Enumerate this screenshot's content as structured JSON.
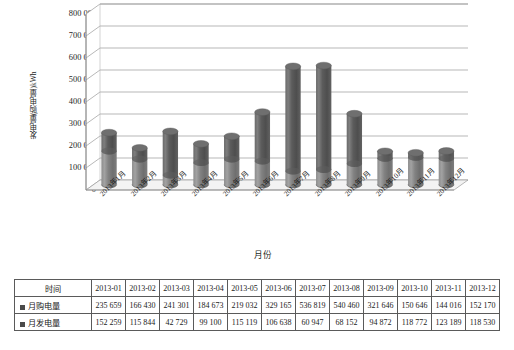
{
  "chart_data": {
    "type": "bar",
    "title": "",
    "xlabel": "月份",
    "ylabel": "发电量(购电量)kWh",
    "categories": [
      "2013年1月",
      "2013年2月",
      "2013年3月",
      "2013年4月",
      "2013年5月",
      "2013年6月",
      "2013年7月",
      "2013年8月",
      "2013年9月",
      "2013年10月",
      "2013年11月",
      "2013年12月"
    ],
    "series": [
      {
        "name": "月购电量",
        "values": [
          235659,
          166430,
          241301,
          184673,
          219032,
          329165,
          536819,
          540460,
          321646,
          150646,
          144016,
          152170
        ]
      },
      {
        "name": "月发电量",
        "values": [
          152259,
          115844,
          42729,
          99100,
          115119,
          106638,
          60947,
          68152,
          94872,
          118772,
          123189,
          118530
        ]
      }
    ],
    "ylim": [
      0,
      800000
    ],
    "yticks": [
      "0",
      "100 000",
      "200 000",
      "300 000",
      "400 000",
      "500 000",
      "600 000",
      "700 000",
      "800 000"
    ],
    "ytick_values": [
      0,
      100000,
      200000,
      300000,
      400000,
      500000,
      600000,
      700000,
      800000
    ],
    "grid": true,
    "legend": "none",
    "bar_style": "3d-cylinder",
    "bar_color": "#5b5b5b",
    "bar_color_top": "#6e6e6e",
    "bar_color_light": "#8a8a8a"
  },
  "table": {
    "row_headers": [
      "时间",
      "月购电量",
      "月发电量"
    ],
    "columns": [
      "2013-01",
      "2013-02",
      "2013-03",
      "2013-04",
      "2013-05",
      "2013-06",
      "2013-07",
      "2013-08",
      "2013-09",
      "2013-10",
      "2013-11",
      "2013-12"
    ],
    "rows": [
      {
        "label": "月购电量",
        "values": [
          "235 659",
          "166 430",
          "241 301",
          "184 673",
          "219 032",
          "329 165",
          "536 819",
          "540 460",
          "321 646",
          "150 646",
          "144 016",
          "152 170"
        ]
      },
      {
        "label": "月发电量",
        "values": [
          "152 259",
          "115 844",
          "42 729",
          "99 100",
          "115 119",
          "106 638",
          "60 947",
          "68 152",
          "94 872",
          "118 772",
          "123 189",
          "118 530"
        ]
      }
    ]
  }
}
